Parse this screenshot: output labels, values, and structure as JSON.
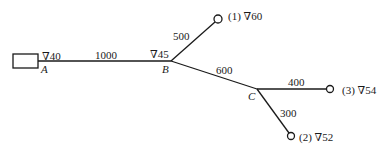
{
  "diagram": {
    "reservoir": {
      "label": "A",
      "elevation": "∇40"
    },
    "junctions": [
      {
        "id": "B",
        "label": "B",
        "elevation": "∇45"
      },
      {
        "id": "C",
        "label": "C"
      }
    ],
    "outlets": [
      {
        "id": "1",
        "label": "(1) ∇60"
      },
      {
        "id": "2",
        "label": "(2) ∇52"
      },
      {
        "id": "3",
        "label": "(3) ∇54"
      }
    ],
    "pipes": [
      {
        "from": "A",
        "to": "B",
        "length": "1000"
      },
      {
        "from": "B",
        "to": "1",
        "length": "500"
      },
      {
        "from": "B",
        "to": "C",
        "length": "600"
      },
      {
        "from": "C",
        "to": "3",
        "length": "400"
      },
      {
        "from": "C",
        "to": "2",
        "length": "300"
      }
    ]
  }
}
